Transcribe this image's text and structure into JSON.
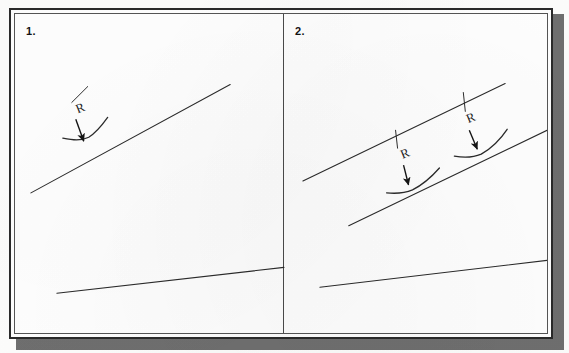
{
  "document": {
    "title": "Radius annotation exercise sheet",
    "page_background": "#fdfdfc",
    "card_background": "#ffffff",
    "ink_color": "#2b2b2b",
    "border_color": "#2a2a2a",
    "shadow_color": "#6f6f6f"
  },
  "panels": [
    {
      "number": "1.",
      "name": "panel-one",
      "annotations": [
        {
          "label": "R",
          "label_x": 63,
          "label_y": 100,
          "leader": {
            "x1": 73,
            "y1": 73,
            "x2": 57,
            "y2": 89
          },
          "arrow": {
            "x1": 61,
            "y1": 106,
            "x2": 69,
            "y2": 128
          }
        }
      ],
      "lines": [
        {
          "name": "main-diagonal",
          "x1": 16,
          "y1": 180,
          "x2": 216,
          "y2": 71
        },
        {
          "name": "lower-diagonal",
          "x1": 42,
          "y1": 281,
          "x2": 270,
          "y2": 255
        }
      ],
      "fillets": [
        {
          "name": "fillet-curve-1",
          "path": "M 48 125 C 58 127, 66 128, 74 124 C 82 119, 88 111, 93 104"
        }
      ]
    },
    {
      "number": "2.",
      "name": "panel-two",
      "annotations": [
        {
          "label": "R",
          "label_x": 389,
          "label_y": 146,
          "leader": {
            "x1": 382,
            "y1": 117,
            "x2": 384,
            "y2": 135
          },
          "arrow": {
            "x1": 390,
            "y1": 152,
            "x2": 395,
            "y2": 172
          }
        },
        {
          "label": "R",
          "label_x": 455,
          "label_y": 110,
          "leader": {
            "x1": 450,
            "y1": 79,
            "x2": 452,
            "y2": 98
          },
          "arrow": {
            "x1": 456,
            "y1": 117,
            "x2": 464,
            "y2": 136
          }
        }
      ],
      "lines": [
        {
          "name": "upper-diagonal",
          "x1": 289,
          "y1": 168,
          "x2": 492,
          "y2": 70
        },
        {
          "name": "middle-diagonal",
          "x1": 335,
          "y1": 213,
          "x2": 534,
          "y2": 117
        },
        {
          "name": "lower-diagonal",
          "x1": 306,
          "y1": 275,
          "x2": 542,
          "y2": 247
        }
      ],
      "fillets": [
        {
          "name": "fillet-curve-1",
          "path": "M 373 180 C 383 181, 392 180, 399 177 C 411 171, 419 163, 426 155"
        },
        {
          "name": "fillet-curve-2",
          "path": "M 441 143 C 452 145, 461 144, 468 141 C 480 134, 488 125, 494 116"
        }
      ]
    }
  ]
}
